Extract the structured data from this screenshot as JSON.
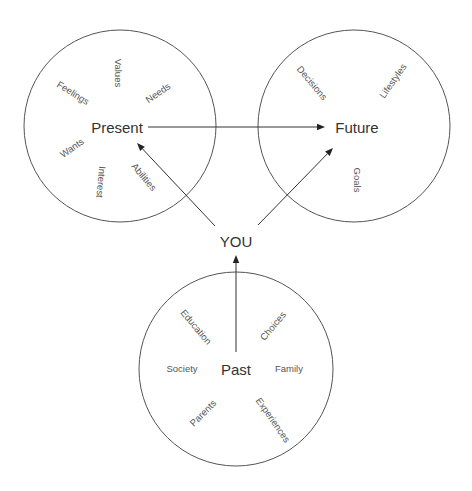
{
  "diagram": {
    "width": 472,
    "height": 491,
    "colors": {
      "background": "#ffffff",
      "circle_stroke": "#555555",
      "arrow": "#333333",
      "main_text": "#333333",
      "sub_text": "#555555"
    },
    "center_node": {
      "label": "YOU",
      "x": 236,
      "y": 241
    },
    "circles": [
      {
        "id": "present",
        "title": "Present",
        "cx": 120,
        "cy": 126,
        "r": 96,
        "title_x": 117,
        "title_y": 127,
        "items": [
          {
            "label": "Values",
            "x": 118,
            "y": 73,
            "rotate": 90
          },
          {
            "label": "Feelings",
            "x": 73,
            "y": 93,
            "rotate": 32
          },
          {
            "label": "Needs",
            "x": 158,
            "y": 93,
            "rotate": -35
          },
          {
            "label": "Wants",
            "x": 72,
            "y": 148,
            "rotate": -35
          },
          {
            "label": "Interest",
            "x": 101,
            "y": 182,
            "rotate": 95
          },
          {
            "label": "Abilities",
            "x": 144,
            "y": 177,
            "rotate": 50
          }
        ]
      },
      {
        "id": "future",
        "title": "Future",
        "cx": 354,
        "cy": 126,
        "r": 96,
        "title_x": 357,
        "title_y": 127,
        "items": [
          {
            "label": "Decisions",
            "x": 312,
            "y": 83,
            "rotate": 50
          },
          {
            "label": "Lifestyles",
            "x": 393,
            "y": 81,
            "rotate": -55
          },
          {
            "label": "Goals",
            "x": 357,
            "y": 180,
            "rotate": 90
          }
        ]
      },
      {
        "id": "past",
        "title": "Past",
        "cx": 236,
        "cy": 369,
        "r": 97,
        "title_x": 236,
        "title_y": 369,
        "items": [
          {
            "label": "Education",
            "x": 196,
            "y": 327,
            "rotate": 50
          },
          {
            "label": "Choices",
            "x": 273,
            "y": 326,
            "rotate": -50
          },
          {
            "label": "Society",
            "x": 182,
            "y": 369,
            "rotate": 0
          },
          {
            "label": "Family",
            "x": 289,
            "y": 369,
            "rotate": 0
          },
          {
            "label": "Parents",
            "x": 203,
            "y": 413,
            "rotate": -45
          },
          {
            "label": "Experiences",
            "x": 273,
            "y": 420,
            "rotate": 55
          }
        ]
      }
    ],
    "arrows": [
      {
        "id": "present-to-future",
        "x1": 148,
        "y1": 127,
        "x2": 325,
        "y2": 127
      },
      {
        "id": "you-to-present",
        "x1": 215,
        "y1": 226,
        "x2": 137,
        "y2": 143
      },
      {
        "id": "you-to-future",
        "x1": 258,
        "y1": 225,
        "x2": 333,
        "y2": 148
      },
      {
        "id": "past-to-you",
        "x1": 236,
        "y1": 352,
        "x2": 236,
        "y2": 255
      }
    ]
  }
}
